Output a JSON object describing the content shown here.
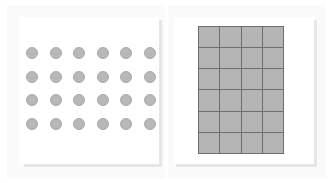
{
  "panels": [
    {
      "name": "dot-array-panel",
      "type": "dot-array",
      "rows": 4,
      "columns": 6,
      "total": 24,
      "dot_color": "#b8b8b8"
    },
    {
      "name": "grid-panel",
      "type": "square-grid",
      "rows": 6,
      "columns": 4,
      "total": 24,
      "cell_color": "#b5b5b5",
      "line_color": "#6e6e6e"
    }
  ]
}
